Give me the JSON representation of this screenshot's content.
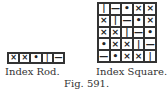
{
  "rod": {
    "label": "Index Rod.",
    "cells": [
      "×",
      "×",
      "•",
      "|",
      "—"
    ]
  },
  "square": {
    "label": "Index Square.",
    "rows": [
      [
        "|",
        "—",
        "•",
        "×",
        "×"
      ],
      [
        "×",
        "|",
        "—",
        "•",
        "×"
      ],
      [
        "×",
        "×",
        "|",
        "—",
        "•"
      ],
      [
        "•",
        "×",
        "×",
        "|",
        "—"
      ],
      [
        "—",
        "•",
        "×",
        "×",
        "|"
      ]
    ]
  },
  "figure": {
    "caption": "Fig. 591."
  }
}
